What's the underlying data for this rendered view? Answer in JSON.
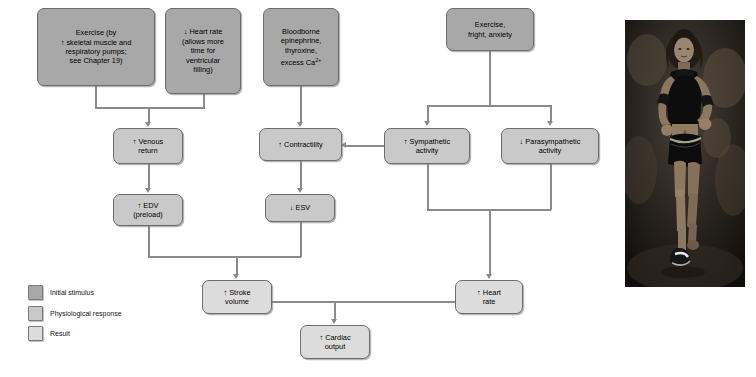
{
  "diagram": {
    "nodes": {
      "exercise_pumps": {
        "label": "Exercise (by ↑ skeletal muscle and respiratory pumps; see Chapter 19)",
        "line1": "Exercise (by",
        "line2": "↑ skeletal muscle and",
        "line3": "respiratory pumps;",
        "line4": "see Chapter 19)",
        "category": "Initial stimulus"
      },
      "heart_rate_down": {
        "label": "↓ Heart rate (allows more time for ventricular filling)",
        "line1": "↓ Heart rate",
        "line2": "(allows more",
        "line3": "time for",
        "line4": "ventricular",
        "line5": "filling)",
        "category": "Initial stimulus"
      },
      "bloodborne": {
        "label": "Bloodborne epinephrine, thyroxine, excess Ca2+",
        "line1": "Bloodborne",
        "line2": "epinephrine,",
        "line3": "thyroxine,",
        "line4_pre": "excess Ca",
        "line4_sup": "2+",
        "category": "Initial stimulus"
      },
      "exercise_fright": {
        "label": "Exercise, fright, anxiety",
        "line1": "Exercise,",
        "line2": "fright, anxiety",
        "category": "Initial stimulus"
      },
      "venous_return": {
        "label": "↑ Venous return",
        "line1": "↑ Venous",
        "line2": "return",
        "category": "Physiological response"
      },
      "contractility": {
        "label": "↑ Contractility",
        "line1": "↑ Contractility",
        "category": "Physiological response"
      },
      "sympathetic": {
        "label": "↑ Sympathetic activity",
        "line1": "↑ Sympathetic",
        "line2": "activity",
        "category": "Physiological response"
      },
      "parasympathetic": {
        "label": "↓ Parasympathetic activity",
        "line1": "↓ Parasympathetic",
        "line2": "activity",
        "category": "Physiological response"
      },
      "edv": {
        "label": "↑ EDV (preload)",
        "line1": "↑ EDV",
        "line2": "(preload)",
        "category": "Physiological response"
      },
      "esv": {
        "label": "↓ ESV",
        "line1": "↓ ESV",
        "category": "Physiological response"
      },
      "stroke_volume": {
        "label": "↑ Stroke volume",
        "line1": "↑ Stroke",
        "line2": "volume",
        "category": "Result"
      },
      "heart_rate_up": {
        "label": "↑ Heart rate",
        "line1": "↑ Heart",
        "line2": "rate",
        "category": "Result"
      },
      "cardiac_output": {
        "label": "↑ Cardiac output",
        "line1": "↑ Cardiac",
        "line2": "output",
        "category": "Result"
      }
    },
    "edges": [
      {
        "from": "exercise_pumps",
        "to": "venous_return"
      },
      {
        "from": "heart_rate_down",
        "to": "venous_return"
      },
      {
        "from": "bloodborne",
        "to": "contractility"
      },
      {
        "from": "exercise_fright",
        "to": "sympathetic"
      },
      {
        "from": "exercise_fright",
        "to": "parasympathetic"
      },
      {
        "from": "sympathetic",
        "to": "contractility"
      },
      {
        "from": "venous_return",
        "to": "edv"
      },
      {
        "from": "contractility",
        "to": "esv"
      },
      {
        "from": "edv",
        "to": "stroke_volume"
      },
      {
        "from": "esv",
        "to": "stroke_volume"
      },
      {
        "from": "sympathetic",
        "to": "heart_rate_up"
      },
      {
        "from": "parasympathetic",
        "to": "heart_rate_up"
      },
      {
        "from": "stroke_volume",
        "to": "cardiac_output"
      },
      {
        "from": "heart_rate_up",
        "to": "cardiac_output"
      }
    ]
  },
  "legend": {
    "items": [
      {
        "label": "Initial stimulus",
        "color": "#a8a8a8"
      },
      {
        "label": "Physiological response",
        "color": "#c9c9c9"
      },
      {
        "label": "Result",
        "color": "#dcdcdc"
      }
    ]
  },
  "photo": {
    "caption": "Woman running outdoors"
  }
}
